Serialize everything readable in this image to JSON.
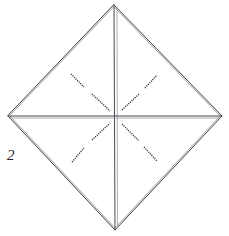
{
  "figure": {
    "step_label": "2",
    "shape": "diamond",
    "colors": {
      "background": "#ffffff",
      "outline": "#3b3b40",
      "outline_soft": "#8d8d95",
      "crease": "#4a4a50",
      "crease_soft": "#9b9ba2",
      "dash": "#2b2b30",
      "label": "#232327"
    },
    "vertices": {
      "top": {
        "x": 114,
        "y": 5
      },
      "right": {
        "x": 222,
        "y": 116
      },
      "bottom": {
        "x": 115,
        "y": 230
      },
      "left": {
        "x": 8,
        "y": 116
      }
    },
    "center": {
      "x": 115,
      "y": 116
    },
    "creases": [
      {
        "name": "vertical-crease",
        "x1": 114,
        "y1": 5,
        "x2": 115,
        "y2": 230
      },
      {
        "name": "horizontal-crease",
        "x1": 8,
        "y1": 116,
        "x2": 222,
        "y2": 116
      }
    ],
    "fold_marks": [
      {
        "name": "fold-mark-upper-left-outer",
        "quadrant": "upper-left",
        "x1": 71,
        "y1": 74,
        "x2": 84,
        "y2": 87
      },
      {
        "name": "fold-mark-upper-left-inner",
        "quadrant": "upper-left",
        "x1": 92,
        "y1": 94,
        "x2": 110,
        "y2": 111
      },
      {
        "name": "fold-mark-upper-right-inner",
        "quadrant": "upper-right",
        "x1": 122,
        "y1": 110,
        "x2": 139,
        "y2": 94
      },
      {
        "name": "fold-mark-upper-right-outer",
        "quadrant": "upper-right",
        "x1": 145,
        "y1": 88,
        "x2": 157,
        "y2": 75
      },
      {
        "name": "fold-mark-lower-left-inner",
        "quadrant": "lower-left",
        "x1": 92,
        "y1": 140,
        "x2": 110,
        "y2": 123
      },
      {
        "name": "fold-mark-lower-left-outer",
        "quadrant": "lower-left",
        "x1": 72,
        "y1": 162,
        "x2": 84,
        "y2": 148
      },
      {
        "name": "fold-mark-lower-right-inner",
        "quadrant": "lower-right",
        "x1": 122,
        "y1": 124,
        "x2": 139,
        "y2": 141
      },
      {
        "name": "fold-mark-lower-right-outer",
        "quadrant": "lower-right",
        "x1": 144,
        "y1": 147,
        "x2": 157,
        "y2": 161
      }
    ]
  }
}
